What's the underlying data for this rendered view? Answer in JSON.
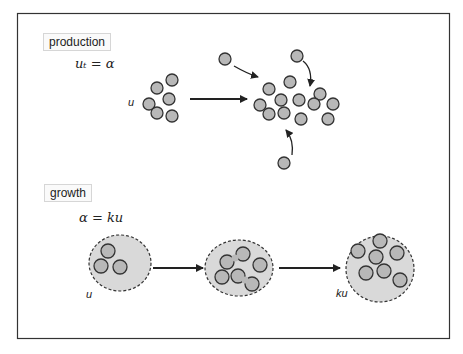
{
  "figure": {
    "frame": {
      "x": 17,
      "y": 13,
      "width": 432,
      "height": 325,
      "stroke": "#333333"
    },
    "colors": {
      "particle_fill": "#b8b8b8",
      "particle_stroke": "#333333",
      "cell_fill": "#d9d9d9",
      "cell_stroke": "#333333",
      "arrow": "#222222"
    }
  },
  "production": {
    "label": "production",
    "equation": "uₜ = α",
    "var_label": "u",
    "cluster_before": [
      [
        172,
        80
      ],
      [
        157,
        88
      ],
      [
        169,
        99
      ],
      [
        149,
        104
      ],
      [
        157,
        113
      ],
      [
        172,
        116
      ]
    ],
    "cluster_after": [
      [
        269,
        89
      ],
      [
        290,
        82
      ],
      [
        281,
        100
      ],
      [
        299,
        100
      ],
      [
        320,
        94
      ],
      [
        260,
        105
      ],
      [
        269,
        114
      ],
      [
        284,
        113
      ],
      [
        301,
        119
      ],
      [
        314,
        104
      ],
      [
        333,
        104
      ],
      [
        328,
        119
      ]
    ],
    "incoming": [
      [
        225,
        59
      ],
      [
        297,
        56
      ],
      [
        284,
        163
      ]
    ]
  },
  "growth": {
    "label": "growth",
    "equation": "α = ku",
    "var_label_start": "u",
    "var_label_end": "ku",
    "cells": [
      {
        "cx": 120,
        "cy": 263,
        "rx": 31,
        "ry": 28,
        "particles": [
          [
            108,
            251
          ],
          [
            101,
            266
          ],
          [
            120,
            267
          ]
        ]
      },
      {
        "cx": 239,
        "cy": 268,
        "rx": 34,
        "ry": 28,
        "particles": [
          [
            222,
            277
          ],
          [
            260,
            265
          ]
        ],
        "dividing": [
          [
            [
              227,
              262
            ],
            [
              243,
              254
            ]
          ],
          [
            [
              238,
              276
            ],
            [
              252,
              284
            ]
          ]
        ]
      },
      {
        "cx": 380,
        "cy": 269,
        "rx": 34,
        "ry": 33,
        "particles": [
          [
            380,
            241
          ],
          [
            358,
            251
          ],
          [
            376,
            257
          ],
          [
            397,
            253
          ],
          [
            366,
            273
          ],
          [
            384,
            271
          ],
          [
            400,
            280
          ]
        ]
      }
    ]
  }
}
